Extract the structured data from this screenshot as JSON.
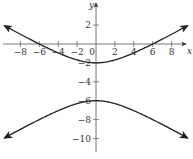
{
  "chart_data": {
    "type": "line",
    "title": "",
    "xlabel": "x",
    "ylabel": "y",
    "xlim": [
      -9,
      9.5
    ],
    "ylim": [
      -11.5,
      4
    ],
    "x_ticks": [
      -8,
      -6,
      -4,
      -2,
      0,
      2,
      4,
      6,
      8
    ],
    "x_tick_labels": [
      "−8",
      "−6",
      "−4",
      "−2",
      "0",
      "2",
      "4",
      "6",
      "8"
    ],
    "y_ticks": [
      2,
      -2,
      -4,
      -6,
      -8,
      -10
    ],
    "y_tick_labels": [
      "2",
      "−2",
      "−4",
      "−6",
      "−8",
      "−10"
    ],
    "grid": false,
    "legend": null,
    "equation": "(y+4)^2/4 - x^2/12 = 1",
    "series": [
      {
        "name": "upper branch",
        "vertex": [
          0,
          -2
        ],
        "x_intercepts": [
          -6,
          6
        ],
        "points": [
          [
            -9,
            1.29
          ],
          [
            -6,
            0
          ],
          [
            -4,
            -0.95
          ],
          [
            -2,
            -1.69
          ],
          [
            0,
            -2
          ],
          [
            2,
            -1.69
          ],
          [
            4,
            -0.95
          ],
          [
            6,
            0
          ],
          [
            9,
            1.29
          ]
        ]
      },
      {
        "name": "lower branch",
        "vertex": [
          0,
          -6
        ],
        "points": [
          [
            -9,
            -9.29
          ],
          [
            -6,
            -8
          ],
          [
            -4,
            -7.06
          ],
          [
            -2,
            -6.31
          ],
          [
            0,
            -6
          ],
          [
            2,
            -6.31
          ],
          [
            4,
            -7.06
          ],
          [
            6,
            -8
          ],
          [
            9,
            -9.29
          ]
        ]
      }
    ]
  },
  "axes": {
    "x_label": "x",
    "y_label": "y"
  }
}
